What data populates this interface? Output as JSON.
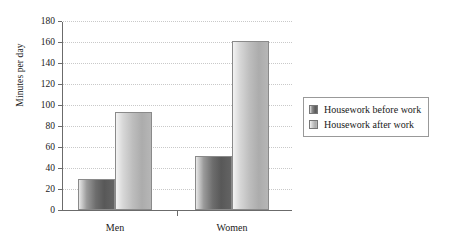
{
  "chart_data": {
    "type": "bar",
    "title": "",
    "xlabel": "",
    "ylabel": "Minutes per day",
    "categories": [
      "Men",
      "Women"
    ],
    "series": [
      {
        "name": "Housework before work",
        "values": [
          30,
          51
        ],
        "color": "#6d6d6d"
      },
      {
        "name": "Housework after work",
        "values": [
          93,
          161
        ],
        "color": "#bdbdbd"
      }
    ],
    "ylim": [
      0,
      180
    ],
    "yticks": [
      0,
      20,
      40,
      60,
      80,
      100,
      120,
      140,
      160,
      180
    ],
    "ytick_labels": [
      "0",
      "20",
      "40",
      "60",
      "80",
      "100",
      "120",
      "140",
      "160",
      "180"
    ],
    "grid": "horizontal-dotted",
    "legend_position": "right"
  },
  "legend": {
    "items": [
      {
        "label": "Housework before work",
        "swatch": "swatch-dark-gradient"
      },
      {
        "label": "Housework after work",
        "swatch": "swatch-light-gradient"
      }
    ]
  }
}
